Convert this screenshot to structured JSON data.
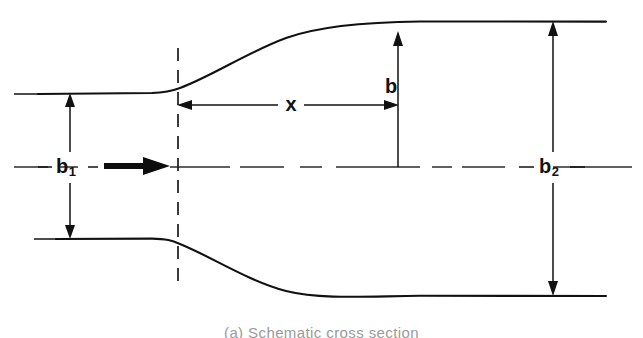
{
  "figure": {
    "kind": "engineering-schematic",
    "background_color": "#ffffff",
    "line_color": "#111111",
    "caption": "(a) Schematic cross section"
  },
  "labels": {
    "inlet_width": {
      "base": "b",
      "sub": "1",
      "text": "b₁"
    },
    "outlet_width": {
      "base": "b",
      "sub": "2",
      "text": "b₂"
    },
    "local_halfwidth": {
      "base": "b",
      "sub": "",
      "text": "b"
    },
    "axial_distance": {
      "base": "x",
      "sub": "",
      "text": "x"
    }
  },
  "annotations": [
    {
      "name": "b1",
      "meaning": "inlet passage width",
      "kind": "double-arrow-vertical"
    },
    {
      "name": "b2",
      "meaning": "outlet passage width",
      "kind": "double-arrow-vertical"
    },
    {
      "name": "b",
      "meaning": "local half-width at station x",
      "kind": "single-arrow-vertical"
    },
    {
      "name": "x",
      "meaning": "axial distance from throat",
      "kind": "double-arrow-horizontal"
    },
    {
      "name": "flow",
      "meaning": "flow direction",
      "kind": "bold-arrow"
    }
  ],
  "geometry": {
    "view_box": "0 0 643 338",
    "centerline_y": 167,
    "throat_x": 178,
    "station_x": 398,
    "inlet": {
      "top_y": 94,
      "bottom_y": 238,
      "left_x": 38,
      "wall_end_x": 160
    },
    "outlet": {
      "top_y": 22,
      "bottom_y": 296,
      "right_x": 606,
      "wall_start_x": 455
    },
    "upper_wall_path": "M 38 94 L 152 93 C 166 92.5 172 91 180 88 C 212 76 248 52 286 38 C 322 25 372 22 420 21.5 C 452 21.3 520 21.6 606 21.6",
    "lower_wall_path": "M 56 239 L 152 238.6 C 166 238.8 172 240.5 180 244 C 212 257 248 281 286 291 C 322 300 372 296 420 295.8 C 452 295.8 520 296 606 296",
    "centerline_dashes": [
      {
        "x1": 14,
        "x2": 48
      },
      {
        "x1": 60,
        "x2": 78
      },
      {
        "x1": 170,
        "x2": 230
      },
      {
        "x1": 240,
        "x2": 284
      },
      {
        "x1": 300,
        "x2": 322
      },
      {
        "x1": 336,
        "x2": 420
      },
      {
        "x1": 432,
        "x2": 452
      },
      {
        "x1": 462,
        "x2": 505
      },
      {
        "x1": 540,
        "x2": 632
      }
    ],
    "throat_dash_array": "13 9",
    "throat_top_y": 48,
    "throat_bottom_y": 282,
    "left_tick_marks": [
      {
        "x1": 14,
        "x2": 38,
        "y": 94
      },
      {
        "x1": 34,
        "x2": 56,
        "y": 239
      }
    ]
  }
}
